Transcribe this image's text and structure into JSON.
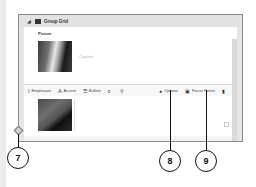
{
  "panel": {
    "title": "Group Grid",
    "collapse_icon": "triangle-down",
    "grid_icon": "grid"
  },
  "items": [
    {
      "label": "Picture",
      "caption_placeholder": "Caption"
    }
  ],
  "toolbar": {
    "emphasize": "Emphasize",
    "accent": "Accent",
    "bullets": "Bullets",
    "list_icon": "≡",
    "link_icon": "link",
    "options": "Options",
    "focus_points": "Focus Points",
    "delete_icon": "trash"
  },
  "callouts": [
    {
      "number": "7"
    },
    {
      "number": "8"
    },
    {
      "number": "9"
    }
  ]
}
